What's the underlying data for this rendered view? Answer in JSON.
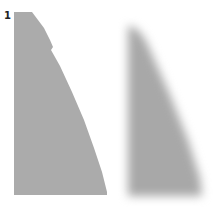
{
  "panel": {
    "label": "1",
    "shape_color": "#ababab",
    "blurred_color": "#a8a8a8"
  }
}
